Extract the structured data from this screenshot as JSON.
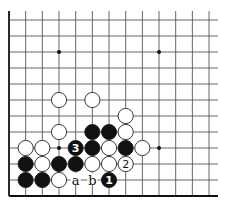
{
  "board": {
    "origin_x": 9,
    "origin_y": 20,
    "spacing_x": 16.67,
    "spacing_y": 16.0,
    "cols": 13,
    "rows": 12,
    "right_extent": 218,
    "top_extent": 11,
    "edges": [
      "left",
      "bottom"
    ],
    "stone_radius": 7.6
  },
  "hoshi": [
    {
      "col": 3,
      "row": 2
    },
    {
      "col": 9,
      "row": 2
    },
    {
      "col": 3,
      "row": 8
    },
    {
      "col": 9,
      "row": 8
    }
  ],
  "stones": [
    {
      "color": "white",
      "col": 3,
      "row": 5
    },
    {
      "color": "white",
      "col": 5,
      "row": 5
    },
    {
      "color": "white",
      "col": 7,
      "row": 6
    },
    {
      "color": "white",
      "col": 3,
      "row": 7
    },
    {
      "color": "black",
      "col": 5,
      "row": 7
    },
    {
      "color": "black",
      "col": 6,
      "row": 7
    },
    {
      "color": "white",
      "col": 7,
      "row": 7
    },
    {
      "color": "white",
      "col": 1,
      "row": 8
    },
    {
      "color": "white",
      "col": 2,
      "row": 8
    },
    {
      "color": "black",
      "col": 4,
      "row": 8,
      "number": "3"
    },
    {
      "color": "black",
      "col": 5,
      "row": 8
    },
    {
      "color": "white",
      "col": 6,
      "row": 8
    },
    {
      "color": "black",
      "col": 7,
      "row": 8
    },
    {
      "color": "white",
      "col": 8,
      "row": 8
    },
    {
      "color": "black",
      "col": 1,
      "row": 9
    },
    {
      "color": "white",
      "col": 2,
      "row": 9
    },
    {
      "color": "black",
      "col": 3,
      "row": 9
    },
    {
      "color": "black",
      "col": 4,
      "row": 9
    },
    {
      "color": "white",
      "col": 5,
      "row": 9
    },
    {
      "color": "white",
      "col": 6,
      "row": 9
    },
    {
      "color": "white",
      "col": 7,
      "row": 9,
      "number": "2"
    },
    {
      "color": "black",
      "col": 1,
      "row": 10
    },
    {
      "color": "black",
      "col": 2,
      "row": 10
    },
    {
      "color": "white",
      "col": 3,
      "row": 10
    },
    {
      "color": "black",
      "col": 6,
      "row": 10,
      "number": "1"
    }
  ],
  "labels": [
    {
      "text": "a",
      "col": 4,
      "row": 10
    },
    {
      "text": "b",
      "col": 5,
      "row": 10
    }
  ]
}
